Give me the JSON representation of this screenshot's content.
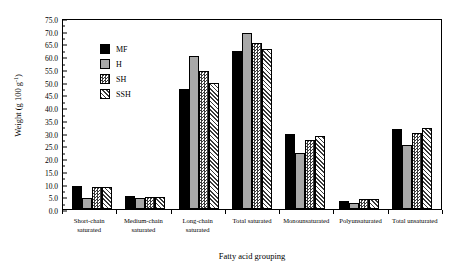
{
  "chart_data": {
    "type": "bar",
    "title": "",
    "xlabel": "Fatty acid grouping",
    "ylabel": "Weight (g 100 g",
    "ylabel_sup": "-1",
    "ylabel_close": ")",
    "ylim": [
      0.0,
      75.0
    ],
    "ytick_step": 5.0,
    "yticks": [
      "0.0",
      "5.0",
      "10.0",
      "15.0",
      "20.0",
      "25.0",
      "30.0",
      "35.0",
      "40.0",
      "45.0",
      "50.0",
      "55.0",
      "60.0",
      "65.0",
      "70.0",
      "75.0"
    ],
    "grid": false,
    "legend_position": "upper left inside",
    "categories": [
      "Short-chain saturated",
      "Medium-chain saturated",
      "Long-chain saturated",
      "Total saturated",
      "Monounsaturated",
      "Polyunsaturated",
      "Total unsaturated"
    ],
    "category_lines": [
      [
        "Short-chain",
        "saturated"
      ],
      [
        "Medium-chain",
        "saturated"
      ],
      [
        "Long-chain",
        "saturated"
      ],
      [
        "Total saturated",
        ""
      ],
      [
        "Monounsaturated",
        ""
      ],
      [
        "Polyunsaturated",
        ""
      ],
      [
        "Total unsaturated",
        ""
      ]
    ],
    "series": [
      {
        "name": "MF",
        "fill": "solid-black",
        "color": "#000000",
        "values": [
          9.0,
          5.0,
          47.0,
          62.0,
          29.5,
          3.3,
          31.5
        ]
      },
      {
        "name": "H",
        "fill": "solid-gray",
        "color": "#a8a8a8",
        "values": [
          4.3,
          4.5,
          60.0,
          69.0,
          22.0,
          2.5,
          25.0
        ]
      },
      {
        "name": "SH",
        "fill": "checker",
        "color": "#3c3c3c",
        "values": [
          8.5,
          4.8,
          54.0,
          65.0,
          27.0,
          4.0,
          30.0
        ]
      },
      {
        "name": "SSH",
        "fill": "cross-hatch",
        "color": "#3a3a3a",
        "values": [
          8.5,
          4.8,
          49.5,
          63.0,
          28.5,
          4.0,
          32.0
        ]
      }
    ]
  },
  "legend": {
    "items": [
      {
        "label": "MF"
      },
      {
        "label": "H"
      },
      {
        "label": "SH"
      },
      {
        "label": "SSH"
      }
    ]
  }
}
